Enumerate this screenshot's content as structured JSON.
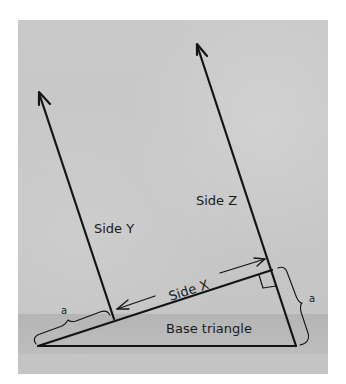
{
  "diagram": {
    "labels": {
      "side_x": "Side X",
      "side_y": "Side Y",
      "side_z": "Side Z",
      "base": "Base triangle",
      "a_left": "a",
      "a_right": "a"
    },
    "colors": {
      "background": "#c6c6c6",
      "ink": "#141414"
    }
  }
}
